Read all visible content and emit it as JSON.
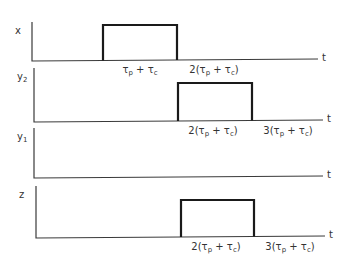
{
  "panels": [
    {
      "id": "x",
      "ylabel": "x",
      "ylabel_sub": "",
      "xlabel": "t",
      "axis_x": 32,
      "axis_top": 22,
      "baseline": 61,
      "axis_end": 318,
      "pulse": {
        "start": 103,
        "end": 177,
        "top": 25
      },
      "ticks": [
        {
          "x": 140,
          "text": "τp + τc",
          "parts": [
            "",
            "τ",
            "p",
            " + τ",
            "c",
            ""
          ]
        },
        {
          "x": 214,
          "text": "2(τp + τc)",
          "parts": [
            "2(",
            "τ",
            "p",
            " + τ",
            "c",
            ")"
          ]
        }
      ]
    },
    {
      "id": "y2",
      "ylabel": "y",
      "ylabel_sub": "2",
      "xlabel": "t",
      "axis_x": 34,
      "axis_top": 68,
      "baseline": 122,
      "axis_end": 323,
      "pulse": {
        "start": 178,
        "end": 252,
        "top": 83
      },
      "ticks": [
        {
          "x": 213,
          "text": "2(τp + τc)",
          "parts": [
            "2(",
            "τ",
            "p",
            " + τ",
            "c",
            ")"
          ]
        },
        {
          "x": 288,
          "text": "3(τp + τc)",
          "parts": [
            "3(",
            "τ",
            "p",
            " + τ",
            "c",
            ")"
          ]
        }
      ]
    },
    {
      "id": "y1",
      "ylabel": "y",
      "ylabel_sub": "1",
      "xlabel": "t",
      "axis_x": 34,
      "axis_top": 128,
      "baseline": 178,
      "axis_end": 323,
      "pulse": null,
      "ticks": []
    },
    {
      "id": "z",
      "ylabel": "z",
      "ylabel_sub": "",
      "xlabel": "t",
      "axis_x": 36,
      "axis_top": 186,
      "baseline": 238,
      "axis_end": 325,
      "pulse": {
        "start": 181,
        "end": 254,
        "top": 200
      },
      "ticks": [
        {
          "x": 216,
          "text": "2(τp + τc)",
          "parts": [
            "2(",
            "τ",
            "p",
            " + τ",
            "c",
            ")"
          ]
        },
        {
          "x": 290,
          "text": "3(τp + τc)",
          "parts": [
            "3(",
            "τ",
            "p",
            " + τ",
            "c",
            ")"
          ]
        }
      ]
    }
  ],
  "colors": {
    "axis": "#3a3a3a",
    "pulse": "#1a1a1a",
    "text": "#333333"
  }
}
